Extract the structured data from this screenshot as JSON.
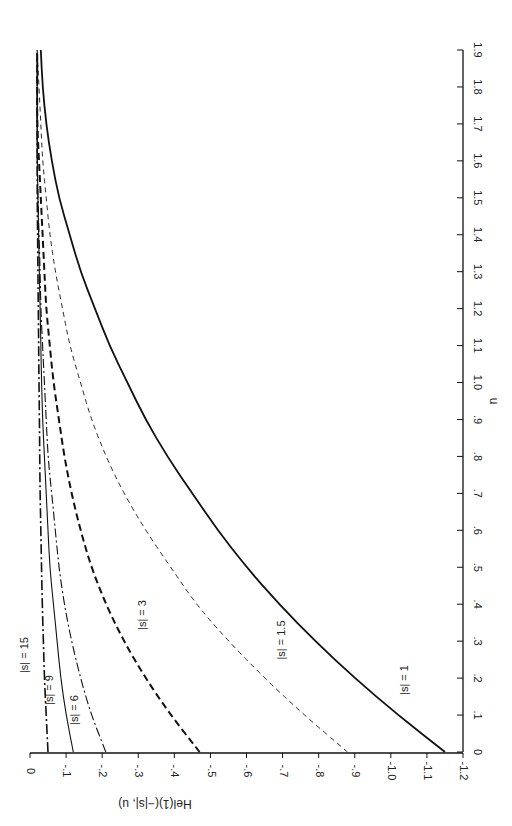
{
  "chart_data": {
    "type": "line",
    "orientation": "rotated-90 (page rotated: u axis runs vertically on right, He axis along bottom)",
    "title": "",
    "xlabel": "u",
    "ylabel": "He_l^(1)(-|s|, u)",
    "xlim": [
      0,
      1.9
    ],
    "ylim": [
      -1.2,
      0
    ],
    "x_ticks": [
      "0",
      ".1",
      ".2",
      ".3",
      ".4",
      ".5",
      ".6",
      ".7",
      ".8",
      ".9",
      "1.0",
      "1.1",
      "1.2",
      "1.3",
      "1.4",
      "1.5",
      "1.6",
      "1.7",
      "1.8",
      "1.9"
    ],
    "y_ticks": [
      "0",
      "-.1",
      "-.2",
      "-.3",
      "-.4",
      "-.5",
      "-.6",
      "-.7",
      "-.8",
      "-.9",
      "-1.0",
      "-1.1",
      "-1.2"
    ],
    "grid": false,
    "legend": "inline curve labels",
    "x": [
      0,
      0.1,
      0.2,
      0.3,
      0.4,
      0.5,
      0.6,
      0.7,
      0.8,
      0.9,
      1.0,
      1.1,
      1.2,
      1.3,
      1.4,
      1.5,
      1.6,
      1.7,
      1.8,
      1.9
    ],
    "series": [
      {
        "name": "|s| = 1",
        "style": "solid-thick",
        "values": [
          -1.15,
          -1.02,
          -0.9,
          -0.79,
          -0.69,
          -0.6,
          -0.52,
          -0.45,
          -0.38,
          -0.32,
          -0.27,
          -0.22,
          -0.18,
          -0.14,
          -0.11,
          -0.08,
          -0.06,
          -0.045,
          -0.035,
          -0.03
        ]
      },
      {
        "name": "|s| = 1.5",
        "style": "dashed-thin",
        "values": [
          -0.88,
          -0.76,
          -0.65,
          -0.55,
          -0.46,
          -0.39,
          -0.32,
          -0.26,
          -0.21,
          -0.17,
          -0.14,
          -0.11,
          -0.09,
          -0.07,
          -0.055,
          -0.045,
          -0.035,
          -0.03,
          -0.025,
          -0.02
        ]
      },
      {
        "name": "|s| = 3",
        "style": "dashed-thick",
        "values": [
          -0.47,
          -0.39,
          -0.32,
          -0.26,
          -0.21,
          -0.17,
          -0.14,
          -0.115,
          -0.095,
          -0.08,
          -0.065,
          -0.055,
          -0.045,
          -0.04,
          -0.035,
          -0.03,
          -0.025,
          -0.02,
          -0.02,
          -0.02
        ]
      },
      {
        "name": "|s| = 6",
        "style": "dash-dot",
        "values": [
          -0.21,
          -0.17,
          -0.14,
          -0.115,
          -0.095,
          -0.08,
          -0.07,
          -0.06,
          -0.05,
          -0.045,
          -0.04,
          -0.035,
          -0.03,
          -0.028,
          -0.025,
          -0.022,
          -0.02,
          -0.02,
          -0.02,
          -0.02
        ]
      },
      {
        "name": "|s| = 9",
        "style": "solid-thin",
        "values": [
          -0.12,
          -0.1,
          -0.085,
          -0.075,
          -0.065,
          -0.055,
          -0.05,
          -0.045,
          -0.04,
          -0.035,
          -0.032,
          -0.03,
          -0.028,
          -0.026,
          -0.024,
          -0.022,
          -0.02,
          -0.02,
          -0.02,
          -0.02
        ]
      },
      {
        "name": "|s| = 15",
        "style": "dash-dot-thick",
        "values": [
          -0.05,
          -0.045,
          -0.04,
          -0.037,
          -0.034,
          -0.032,
          -0.03,
          -0.028,
          -0.027,
          -0.026,
          -0.025,
          -0.024,
          -0.023,
          -0.022,
          -0.021,
          -0.02,
          -0.02,
          -0.02,
          -0.02,
          -0.02
        ]
      }
    ]
  },
  "labels": {
    "u_axis_title": "u",
    "he_axis_title": "He",
    "he_axis_sub": "l",
    "he_axis_sup": "(1)",
    "he_axis_args": "(−|s|, u)",
    "curve_labels": [
      "|s| = 1",
      "|s| = 1.5",
      "|s| = 3",
      "|s| = 6",
      "|s| = 9",
      "|s| = 15"
    ]
  }
}
